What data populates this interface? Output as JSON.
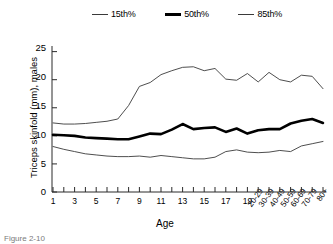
{
  "chart_data": {
    "type": "line",
    "title": "",
    "xlabel": "Age",
    "ylabel": "Triceps skinfold (mm), males",
    "ylim": [
      0,
      26
    ],
    "yticks": [
      0,
      5,
      10,
      15,
      20,
      25
    ],
    "grid": false,
    "legend_position": "top",
    "categories": [
      "1",
      "2",
      "3",
      "4",
      "5",
      "6",
      "7",
      "8",
      "9",
      "10",
      "11",
      "12",
      "13",
      "14",
      "15",
      "16",
      "17",
      "18",
      "19",
      "20-29",
      "30-39",
      "40-49",
      "50-59",
      "60-69",
      "70-79",
      "80+"
    ],
    "xtick_labels": [
      "1",
      "3",
      "5",
      "7",
      "9",
      "11",
      "13",
      "15",
      "17",
      "19",
      "20-29",
      "30-39",
      "40-49",
      "50-59",
      "60-69",
      "70-79",
      "80+"
    ],
    "series": [
      {
        "name": "15th%",
        "values": [
          8.1,
          7.6,
          7.2,
          6.8,
          6.6,
          6.4,
          6.3,
          6.3,
          6.4,
          6.2,
          6.5,
          6.3,
          6.1,
          5.9,
          5.9,
          6.2,
          7.2,
          7.5,
          7.1,
          7.0,
          7.1,
          7.4,
          7.2,
          8.2,
          8.6,
          9.0
        ]
      },
      {
        "name": "50th%",
        "values": [
          10.2,
          10.1,
          10.0,
          9.7,
          9.6,
          9.5,
          9.4,
          9.4,
          9.9,
          10.4,
          10.3,
          11.1,
          12.1,
          11.2,
          11.4,
          11.5,
          10.7,
          11.3,
          10.4,
          11.0,
          11.2,
          11.2,
          12.2,
          12.7,
          13.0,
          12.3
        ]
      },
      {
        "name": "85th%",
        "values": [
          12.3,
          12.1,
          12.1,
          12.2,
          12.4,
          12.6,
          13.0,
          15.4,
          18.8,
          19.5,
          20.9,
          21.6,
          22.2,
          22.3,
          21.6,
          22.0,
          20.1,
          19.9,
          21.1,
          19.6,
          21.3,
          20.0,
          19.6,
          20.8,
          20.6,
          18.4
        ]
      }
    ],
    "legend": [
      "15th%",
      "50th%",
      "85th%"
    ]
  },
  "legend": {
    "items": [
      {
        "label": "15th%",
        "style": "thin"
      },
      {
        "label": "50th%",
        "style": "thick"
      },
      {
        "label": "85th%",
        "style": "thin"
      }
    ]
  },
  "axes": {
    "ylabel": "Triceps skinfold (mm), males",
    "xlabel": "Age",
    "yticks": [
      "25",
      "20",
      "15",
      "10",
      "5",
      "0"
    ],
    "xticks_plain": [
      "1",
      "3",
      "5",
      "7",
      "9",
      "11",
      "13",
      "15",
      "17",
      "19"
    ],
    "xticks_rotated": [
      "20-29",
      "30-39",
      "40-49",
      "50-59",
      "60-69",
      "70-79",
      "80+"
    ]
  },
  "caption": {
    "text": "Figure 2-10"
  },
  "colors": {
    "line_thin": "#3a3a3a",
    "line_thick": "#000000",
    "axis": "#2b2b2b",
    "text": "#000000"
  }
}
